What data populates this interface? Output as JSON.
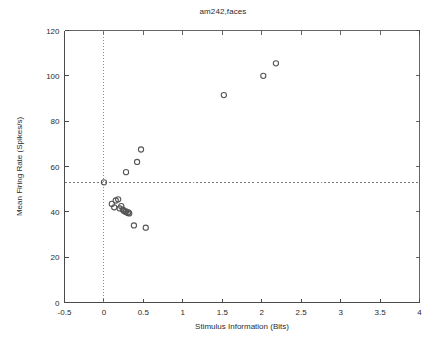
{
  "chart_data": {
    "type": "scatter",
    "title": "am242,faces",
    "xlabel": "Stimulus Information (Bits)",
    "ylabel": "Mean Firing Rate (Spikes/s)",
    "xlim": [
      -0.5,
      4
    ],
    "ylim": [
      0,
      120
    ],
    "xticks": [
      -0.5,
      0,
      0.5,
      1,
      1.5,
      2,
      2.5,
      3,
      3.5,
      4
    ],
    "xticklabels": [
      "-0.5",
      "0",
      "0.5",
      "1",
      "1.5",
      "2",
      "2.5",
      "3",
      "3.5",
      "4"
    ],
    "yticks": [
      0,
      20,
      40,
      60,
      80,
      100,
      120
    ],
    "yticklabels": [
      "0",
      "20",
      "40",
      "60",
      "80",
      "100",
      "120"
    ],
    "grid": false,
    "legend": null,
    "marker": "open-circle",
    "marker_color": "#565656",
    "reference_lines": [
      {
        "orientation": "vertical",
        "value": 0,
        "style": "dotted",
        "color": "#8a8a8a"
      },
      {
        "orientation": "horizontal",
        "value": 53,
        "style": "dashed",
        "color": "#7a7a7a"
      }
    ],
    "points": [
      {
        "x": 0.0,
        "y": 53.0
      },
      {
        "x": 0.1,
        "y": 43.5
      },
      {
        "x": 0.13,
        "y": 42.0
      },
      {
        "x": 0.15,
        "y": 45.0
      },
      {
        "x": 0.18,
        "y": 45.5
      },
      {
        "x": 0.2,
        "y": 41.5
      },
      {
        "x": 0.22,
        "y": 42.5
      },
      {
        "x": 0.24,
        "y": 41.0
      },
      {
        "x": 0.25,
        "y": 40.5
      },
      {
        "x": 0.27,
        "y": 40.0
      },
      {
        "x": 0.28,
        "y": 40.2
      },
      {
        "x": 0.3,
        "y": 39.5
      },
      {
        "x": 0.31,
        "y": 39.8
      },
      {
        "x": 0.32,
        "y": 39.3
      },
      {
        "x": 0.28,
        "y": 57.5
      },
      {
        "x": 0.42,
        "y": 62.0
      },
      {
        "x": 0.47,
        "y": 67.5
      },
      {
        "x": 0.38,
        "y": 34.0
      },
      {
        "x": 0.53,
        "y": 33.0
      },
      {
        "x": 1.52,
        "y": 91.5
      },
      {
        "x": 2.02,
        "y": 100.0
      },
      {
        "x": 2.18,
        "y": 105.5
      }
    ]
  }
}
